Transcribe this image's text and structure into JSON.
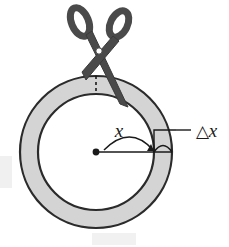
{
  "figure": {
    "background_color": "#ffffff"
  },
  "colors": {
    "ring_fill": "#d4d4d4",
    "ring_stroke": "#2b2b2b",
    "scissors_fill": "#4a4a4a",
    "scissors_stroke": "#2b2b2b",
    "line_color": "#1a1a1a",
    "label_color": "#1a1a1a",
    "artifact_gray": "#efefef"
  },
  "geometry": {
    "center_x": 96,
    "center_y": 152,
    "outer_radius": 76,
    "inner_radius": 58,
    "ring_thickness": 18
  },
  "labels": {
    "radius_label": "x",
    "thickness_delta_symbol": "△",
    "thickness_variable": "x",
    "thickness_label_full": "△ x"
  },
  "elements": {
    "center_dot_name": "center-point",
    "radius_line_name": "radius-line",
    "arc_name": "angle-arc",
    "dashed_cut_line_name": "dashed-cut-line",
    "right_angle_bracket_name": "right-angle-bracket",
    "leader_line_name": "leader-line"
  }
}
